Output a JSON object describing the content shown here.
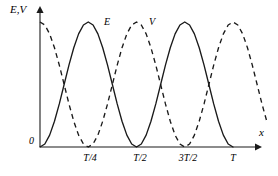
{
  "figure": {
    "axis_y_title": "E,V",
    "axis_x_title": "x",
    "origin_label": "0",
    "curve_label_e": "E",
    "curve_label_v": "V",
    "ink_color": "#1a1a1a",
    "background_color": "#ffffff"
  },
  "chart_data": {
    "type": "line",
    "title": "",
    "xlabel": "x",
    "ylabel": "E,V",
    "grid": false,
    "legend": "inline-curve-labels",
    "xlim": [
      0,
      1.2
    ],
    "ylim": [
      0,
      1.08
    ],
    "x_tick_labels": [
      "T/4",
      "T/2",
      "3T/2",
      "T"
    ],
    "x_tick_values": [
      0.25,
      0.5,
      0.75,
      1.0
    ],
    "y_tick_labels": [
      "0"
    ],
    "y_tick_values": [
      0
    ],
    "annotations": [
      {
        "text": "E",
        "x": 0.35,
        "y": 1.0
      },
      {
        "text": "V",
        "x": 0.6,
        "y": 1.0
      }
    ],
    "series": [
      {
        "name": "E",
        "label": "E",
        "style": "solid",
        "formula": "sin^2(2*pi*x/T)",
        "x": [
          0.0,
          0.025,
          0.05,
          0.075,
          0.1,
          0.125,
          0.15,
          0.175,
          0.2,
          0.225,
          0.25,
          0.275,
          0.3,
          0.325,
          0.35,
          0.375,
          0.4,
          0.425,
          0.45,
          0.475,
          0.5,
          0.525,
          0.55,
          0.575,
          0.6,
          0.625,
          0.65,
          0.675,
          0.7,
          0.725,
          0.75,
          0.775,
          0.8,
          0.825,
          0.85,
          0.875,
          0.9,
          0.925,
          0.95,
          0.975,
          1.0
        ],
        "values": [
          0.0,
          0.024,
          0.095,
          0.206,
          0.345,
          0.5,
          0.655,
          0.794,
          0.905,
          0.976,
          1.0,
          0.976,
          0.905,
          0.794,
          0.655,
          0.5,
          0.345,
          0.206,
          0.095,
          0.024,
          0.0,
          0.024,
          0.095,
          0.206,
          0.345,
          0.5,
          0.655,
          0.794,
          0.905,
          0.976,
          1.0,
          0.976,
          0.905,
          0.794,
          0.655,
          0.5,
          0.345,
          0.206,
          0.095,
          0.024,
          0.0
        ]
      },
      {
        "name": "V",
        "label": "V",
        "style": "dashed",
        "formula": "cos^2(2*pi*x/T)",
        "x": [
          0.0,
          0.025,
          0.05,
          0.075,
          0.1,
          0.125,
          0.15,
          0.175,
          0.2,
          0.225,
          0.25,
          0.275,
          0.3,
          0.325,
          0.35,
          0.375,
          0.4,
          0.425,
          0.45,
          0.475,
          0.5,
          0.525,
          0.55,
          0.575,
          0.6,
          0.625,
          0.65,
          0.675,
          0.7,
          0.725,
          0.75,
          0.775,
          0.8,
          0.825,
          0.85,
          0.875,
          0.9,
          0.925,
          0.95,
          0.975,
          1.0,
          1.025,
          1.05,
          1.075,
          1.1,
          1.125,
          1.15,
          1.175
        ],
        "values": [
          1.0,
          0.976,
          0.905,
          0.794,
          0.655,
          0.5,
          0.345,
          0.206,
          0.095,
          0.024,
          0.0,
          0.024,
          0.095,
          0.206,
          0.345,
          0.5,
          0.655,
          0.794,
          0.905,
          0.976,
          1.0,
          0.976,
          0.905,
          0.794,
          0.655,
          0.5,
          0.345,
          0.206,
          0.095,
          0.024,
          0.0,
          0.024,
          0.095,
          0.206,
          0.345,
          0.5,
          0.655,
          0.794,
          0.905,
          0.976,
          1.0,
          0.976,
          0.905,
          0.794,
          0.655,
          0.5,
          0.345,
          0.206
        ]
      }
    ]
  },
  "geometry": {
    "origin_px": [
      40,
      147
    ],
    "x_axis_end_px": [
      258,
      147
    ],
    "y_axis_top_px": [
      40,
      10
    ],
    "x_unit_px": 193,
    "y_unit_px": 125,
    "tick_px": [
      90,
      140,
      188,
      233
    ],
    "tick_label_y_px": 153
  }
}
